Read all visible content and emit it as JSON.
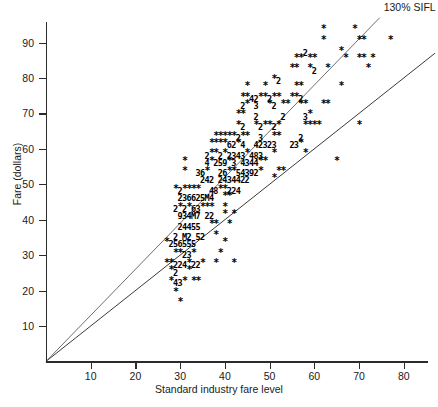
{
  "chart_data": {
    "type": "scatter",
    "title": "",
    "xlabel": "Standard industry fare level",
    "ylabel": "Fare (dollars)",
    "xlim": [
      0,
      87
    ],
    "ylim": [
      0,
      97
    ],
    "xticks": [
      10,
      20,
      30,
      40,
      50,
      60,
      70,
      80
    ],
    "yticks": [
      10,
      20,
      30,
      40,
      50,
      60,
      70,
      80,
      90
    ],
    "grid": false,
    "legend_position": "inline-right",
    "marker_encoding": "Character overstrike plot: '*' = 1 observation at that cell; a digit 2-9 = that many coincident observations; 'M' = 10 or more coincident observations.",
    "reference_lines": [
      {
        "name": "SIFL",
        "label": "SIFL",
        "slope": 1.0,
        "intercept": 0,
        "through_origin": true,
        "color": "#3a3a3a"
      },
      {
        "name": "130% SIFL",
        "label": "130% SIFL",
        "slope": 1.3,
        "intercept": 0,
        "through_origin": true,
        "color": "#6e6e6e"
      }
    ],
    "rows": [
      {
        "y": 93,
        "cells": [
          {
            "x": 62,
            "m": "*"
          },
          {
            "x": 69,
            "m": "*"
          }
        ]
      },
      {
        "y": 90,
        "cells": [
          {
            "x": 62,
            "m": "*"
          },
          {
            "x": 70,
            "m": "*"
          },
          {
            "x": 71,
            "m": "*"
          },
          {
            "x": 77,
            "m": "*"
          }
        ]
      },
      {
        "y": 87,
        "cells": [
          {
            "x": 58,
            "m": "2"
          },
          {
            "x": 66,
            "m": "*"
          }
        ]
      },
      {
        "y": 85,
        "cells": [
          {
            "x": 56,
            "m": "*"
          },
          {
            "x": 57,
            "m": "*"
          },
          {
            "x": 59,
            "m": "*"
          },
          {
            "x": 60,
            "m": "*"
          },
          {
            "x": 67,
            "m": "*"
          },
          {
            "x": 70,
            "m": "*"
          },
          {
            "x": 71,
            "m": "*"
          },
          {
            "x": 73,
            "m": "*"
          }
        ]
      },
      {
        "y": 82,
        "cells": [
          {
            "x": 55,
            "m": "*"
          },
          {
            "x": 56,
            "m": "*"
          },
          {
            "x": 59,
            "m": "*"
          },
          {
            "x": 60,
            "m": "2"
          },
          {
            "x": 63,
            "m": "*"
          },
          {
            "x": 72,
            "m": "*"
          }
        ]
      },
      {
        "y": 79,
        "cells": [
          {
            "x": 51,
            "m": "*"
          },
          {
            "x": 52,
            "m": "2"
          }
        ]
      },
      {
        "y": 77,
        "cells": [
          {
            "x": 45,
            "m": "*"
          },
          {
            "x": 49,
            "m": "*"
          },
          {
            "x": 56,
            "m": "*"
          },
          {
            "x": 57,
            "m": "*"
          },
          {
            "x": 66,
            "m": "*"
          }
        ]
      },
      {
        "y": 74,
        "cells": [
          {
            "x": 44,
            "m": "*"
          },
          {
            "x": 45,
            "m": "*"
          },
          {
            "x": 46,
            "m": "4"
          },
          {
            "x": 47,
            "m": "2"
          },
          {
            "x": 48,
            "m": "*"
          },
          {
            "x": 49,
            "m": "*"
          },
          {
            "x": 50,
            "m": "2"
          },
          {
            "x": 51,
            "m": "*"
          },
          {
            "x": 52,
            "m": "*"
          },
          {
            "x": 55,
            "m": "*"
          },
          {
            "x": 56,
            "m": "*"
          },
          {
            "x": 57,
            "m": "2"
          }
        ]
      },
      {
        "y": 72,
        "cells": [
          {
            "x": 44,
            "m": "2"
          },
          {
            "x": 45,
            "m": "*"
          },
          {
            "x": 47,
            "m": "3"
          },
          {
            "x": 50,
            "m": "*"
          },
          {
            "x": 51,
            "m": "2"
          },
          {
            "x": 53,
            "m": "*"
          },
          {
            "x": 54,
            "m": "*"
          },
          {
            "x": 57,
            "m": "*"
          },
          {
            "x": 58,
            "m": "*"
          },
          {
            "x": 62,
            "m": "*"
          },
          {
            "x": 63,
            "m": "*"
          }
        ]
      },
      {
        "y": 69,
        "cells": [
          {
            "x": 43,
            "m": "*"
          },
          {
            "x": 44,
            "m": "*"
          },
          {
            "x": 47,
            "m": "2"
          },
          {
            "x": 53,
            "m": "2"
          },
          {
            "x": 58,
            "m": "3"
          },
          {
            "x": 59,
            "m": "*"
          }
        ]
      },
      {
        "y": 66,
        "cells": [
          {
            "x": 43,
            "m": "*"
          },
          {
            "x": 44,
            "m": "2"
          },
          {
            "x": 47,
            "m": "*"
          },
          {
            "x": 48,
            "m": "2"
          },
          {
            "x": 49,
            "m": "*"
          },
          {
            "x": 50,
            "m": "*"
          },
          {
            "x": 51,
            "m": "2"
          },
          {
            "x": 52,
            "m": "*"
          },
          {
            "x": 58,
            "m": "*"
          },
          {
            "x": 59,
            "m": "*"
          },
          {
            "x": 60,
            "m": "*"
          },
          {
            "x": 61,
            "m": "*"
          },
          {
            "x": 70,
            "m": "*"
          }
        ]
      },
      {
        "y": 63,
        "cells": [
          {
            "x": 38,
            "m": "*"
          },
          {
            "x": 39,
            "m": "*"
          },
          {
            "x": 40,
            "m": "*"
          },
          {
            "x": 41,
            "m": "*"
          },
          {
            "x": 42,
            "m": "*"
          },
          {
            "x": 43,
            "m": "2"
          },
          {
            "x": 44,
            "m": "*"
          },
          {
            "x": 45,
            "m": "*"
          },
          {
            "x": 48,
            "m": "3"
          },
          {
            "x": 51,
            "m": "*"
          },
          {
            "x": 52,
            "m": "*"
          },
          {
            "x": 57,
            "m": "2"
          }
        ]
      },
      {
        "y": 61,
        "cells": [
          {
            "x": 37,
            "m": "*"
          },
          {
            "x": 38,
            "m": "*"
          },
          {
            "x": 39,
            "m": "*"
          },
          {
            "x": 40,
            "m": "*"
          },
          {
            "x": 41,
            "m": "6"
          },
          {
            "x": 42,
            "m": "2"
          },
          {
            "x": 43,
            "m": "*"
          },
          {
            "x": 44,
            "m": "4"
          },
          {
            "x": 47,
            "m": "4"
          },
          {
            "x": 48,
            "m": "2"
          },
          {
            "x": 49,
            "m": "3"
          },
          {
            "x": 50,
            "m": "2"
          },
          {
            "x": 51,
            "m": "3"
          },
          {
            "x": 55,
            "m": "2"
          },
          {
            "x": 56,
            "m": "3"
          },
          {
            "x": 57,
            "m": "*"
          }
        ]
      },
      {
        "y": 58,
        "cells": [
          {
            "x": 36,
            "m": "2"
          },
          {
            "x": 37,
            "m": "*"
          },
          {
            "x": 38,
            "m": "*"
          },
          {
            "x": 39,
            "m": "2"
          },
          {
            "x": 40,
            "m": "*"
          },
          {
            "x": 41,
            "m": "2"
          },
          {
            "x": 42,
            "m": "3"
          },
          {
            "x": 43,
            "m": "4"
          },
          {
            "x": 44,
            "m": "3"
          },
          {
            "x": 45,
            "m": "*"
          },
          {
            "x": 46,
            "m": "4"
          },
          {
            "x": 47,
            "m": "8"
          },
          {
            "x": 48,
            "m": "3"
          },
          {
            "x": 51,
            "m": "*"
          },
          {
            "x": 58,
            "m": "*"
          }
        ]
      },
      {
        "y": 56,
        "cells": [
          {
            "x": 31,
            "m": "*"
          },
          {
            "x": 36,
            "m": "4"
          },
          {
            "x": 37,
            "m": "*"
          },
          {
            "x": 38,
            "m": "2"
          },
          {
            "x": 39,
            "m": "5"
          },
          {
            "x": 40,
            "m": "9"
          },
          {
            "x": 41,
            "m": "*"
          },
          {
            "x": 42,
            "m": "3"
          },
          {
            "x": 44,
            "m": "4"
          },
          {
            "x": 45,
            "m": "3"
          },
          {
            "x": 46,
            "m": "4"
          },
          {
            "x": 47,
            "m": "4"
          },
          {
            "x": 48,
            "m": "*"
          },
          {
            "x": 49,
            "m": "*"
          },
          {
            "x": 65,
            "m": "*"
          }
        ]
      },
      {
        "y": 53,
        "cells": [
          {
            "x": 31,
            "m": "*"
          },
          {
            "x": 34,
            "m": "3"
          },
          {
            "x": 35,
            "m": "6"
          },
          {
            "x": 36,
            "m": "*"
          },
          {
            "x": 39,
            "m": "2"
          },
          {
            "x": 40,
            "m": "6"
          },
          {
            "x": 41,
            "m": "*"
          },
          {
            "x": 42,
            "m": "*"
          },
          {
            "x": 43,
            "m": "5"
          },
          {
            "x": 44,
            "m": "4"
          },
          {
            "x": 45,
            "m": "3"
          },
          {
            "x": 46,
            "m": "9"
          },
          {
            "x": 47,
            "m": "2"
          },
          {
            "x": 48,
            "m": "*"
          },
          {
            "x": 52,
            "m": "*"
          },
          {
            "x": 53,
            "m": "*"
          }
        ]
      },
      {
        "y": 51,
        "cells": [
          {
            "x": 35,
            "m": "2"
          },
          {
            "x": 36,
            "m": "4"
          },
          {
            "x": 37,
            "m": "2"
          },
          {
            "x": 39,
            "m": "2"
          },
          {
            "x": 40,
            "m": "4"
          },
          {
            "x": 41,
            "m": "3"
          },
          {
            "x": 42,
            "m": "4"
          },
          {
            "x": 43,
            "m": "4"
          },
          {
            "x": 44,
            "m": "2"
          },
          {
            "x": 45,
            "m": "2"
          },
          {
            "x": 51,
            "m": "*"
          }
        ]
      },
      {
        "y": 48,
        "cells": [
          {
            "x": 29,
            "m": "*"
          },
          {
            "x": 30,
            "m": "2"
          },
          {
            "x": 31,
            "m": "*"
          },
          {
            "x": 32,
            "m": "*"
          },
          {
            "x": 33,
            "m": "*"
          },
          {
            "x": 34,
            "m": "*"
          },
          {
            "x": 37,
            "m": "4"
          },
          {
            "x": 38,
            "m": "8"
          },
          {
            "x": 39,
            "m": "*"
          },
          {
            "x": 40,
            "m": "*"
          },
          {
            "x": 41,
            "m": "2"
          },
          {
            "x": 42,
            "m": "2"
          },
          {
            "x": 43,
            "m": "4"
          }
        ]
      },
      {
        "y": 46,
        "cells": [
          {
            "x": 30,
            "m": "2"
          },
          {
            "x": 31,
            "m": "3"
          },
          {
            "x": 32,
            "m": "6"
          },
          {
            "x": 33,
            "m": "6"
          },
          {
            "x": 34,
            "m": "2"
          },
          {
            "x": 35,
            "m": "5"
          },
          {
            "x": 36,
            "m": "M"
          },
          {
            "x": 37,
            "m": "4"
          },
          {
            "x": 40,
            "m": "*"
          },
          {
            "x": 41,
            "m": "*"
          }
        ]
      },
      {
        "y": 43,
        "cells": [
          {
            "x": 29,
            "m": "2"
          },
          {
            "x": 30,
            "m": "*"
          },
          {
            "x": 31,
            "m": "2"
          },
          {
            "x": 32,
            "m": "*"
          },
          {
            "x": 33,
            "m": "6"
          },
          {
            "x": 34,
            "m": "3"
          },
          {
            "x": 35,
            "m": "*"
          },
          {
            "x": 36,
            "m": "*"
          },
          {
            "x": 37,
            "m": "*"
          },
          {
            "x": 40,
            "m": "*"
          }
        ]
      },
      {
        "y": 41,
        "cells": [
          {
            "x": 30,
            "m": "9"
          },
          {
            "x": 31,
            "m": "3"
          },
          {
            "x": 32,
            "m": "4"
          },
          {
            "x": 33,
            "m": "M"
          },
          {
            "x": 34,
            "m": "7"
          },
          {
            "x": 36,
            "m": "2"
          },
          {
            "x": 37,
            "m": "2"
          },
          {
            "x": 40,
            "m": "*"
          },
          {
            "x": 42,
            "m": "*"
          }
        ]
      },
      {
        "y": 38,
        "cells": [
          {
            "x": 30,
            "m": "2"
          },
          {
            "x": 31,
            "m": "4"
          },
          {
            "x": 32,
            "m": "4"
          },
          {
            "x": 33,
            "m": "5"
          },
          {
            "x": 34,
            "m": "5"
          },
          {
            "x": 37,
            "m": "*"
          },
          {
            "x": 38,
            "m": "*"
          },
          {
            "x": 41,
            "m": "*"
          }
        ]
      },
      {
        "y": 35,
        "cells": [
          {
            "x": 29,
            "m": "2"
          },
          {
            "x": 31,
            "m": "M"
          },
          {
            "x": 32,
            "m": "2"
          },
          {
            "x": 34,
            "m": "5"
          },
          {
            "x": 35,
            "m": "2"
          },
          {
            "x": 38,
            "m": "*"
          }
        ]
      },
      {
        "y": 33,
        "cells": [
          {
            "x": 27,
            "m": "*"
          },
          {
            "x": 28,
            "m": "2"
          },
          {
            "x": 29,
            "m": "5"
          },
          {
            "x": 30,
            "m": "6"
          },
          {
            "x": 31,
            "m": "5"
          },
          {
            "x": 32,
            "m": "5"
          },
          {
            "x": 33,
            "m": "5"
          },
          {
            "x": 40,
            "m": "*"
          }
        ]
      },
      {
        "y": 30,
        "cells": [
          {
            "x": 29,
            "m": "*"
          },
          {
            "x": 30,
            "m": "*"
          },
          {
            "x": 31,
            "m": "2"
          },
          {
            "x": 32,
            "m": "3"
          },
          {
            "x": 33,
            "m": "*"
          },
          {
            "x": 39,
            "m": "*"
          }
        ]
      },
      {
        "y": 27,
        "cells": [
          {
            "x": 27,
            "m": "*"
          },
          {
            "x": 28,
            "m": "*"
          },
          {
            "x": 29,
            "m": "2"
          },
          {
            "x": 30,
            "m": "2"
          },
          {
            "x": 31,
            "m": "4"
          },
          {
            "x": 32,
            "m": "*"
          },
          {
            "x": 33,
            "m": "2"
          },
          {
            "x": 34,
            "m": "2"
          },
          {
            "x": 35,
            "m": "*"
          },
          {
            "x": 38,
            "m": "*"
          },
          {
            "x": 42,
            "m": "*"
          }
        ]
      },
      {
        "y": 25,
        "cells": [
          {
            "x": 28,
            "m": "*"
          },
          {
            "x": 29,
            "m": "2"
          },
          {
            "x": 32,
            "m": "*"
          }
        ]
      },
      {
        "y": 22,
        "cells": [
          {
            "x": 28,
            "m": "*"
          },
          {
            "x": 29,
            "m": "4"
          },
          {
            "x": 30,
            "m": "3"
          },
          {
            "x": 31,
            "m": "*"
          },
          {
            "x": 33,
            "m": "*"
          },
          {
            "x": 34,
            "m": "*"
          }
        ]
      },
      {
        "y": 19,
        "cells": [
          {
            "x": 29,
            "m": "*"
          }
        ]
      },
      {
        "y": 16,
        "cells": [
          {
            "x": 30,
            "m": "*"
          }
        ]
      }
    ]
  }
}
